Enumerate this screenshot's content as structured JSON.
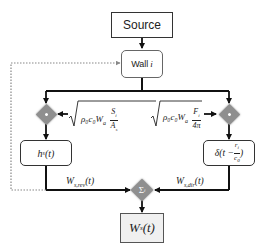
{
  "nodes": {
    "source": "Source",
    "wall": "Wall i",
    "hs": "h_s(t)",
    "delta": "δ(t − r_i / c_0)",
    "sum": "Σ_i",
    "ws": "W_s(t)"
  },
  "gains": {
    "left": {
      "prefix": "ρ₀c₀W",
      "sub": "a",
      "num": "S_i",
      "den": "A_s"
    },
    "right": {
      "prefix": "ρ₀c₀W",
      "sub": "a",
      "num": "F_i",
      "den": "4π"
    }
  },
  "edge_labels": {
    "rev": "W_s,rev(t)",
    "dir": "W_s,dir(t)"
  },
  "display": {
    "source": "Source",
    "wall_prefix": "Wall ",
    "wall_var": "i",
    "hs_main": "h",
    "hs_sub": "s",
    "hs_arg": "(t)",
    "delta_main": "δ(t − ",
    "delta_num": "r",
    "delta_num_sub": "i",
    "delta_den": "c",
    "delta_den_sub": "0",
    "delta_close": ")",
    "sum_main": "Σ",
    "sum_sub": "i",
    "ws_main": "W",
    "ws_sub": "s",
    "ws_arg": "(t)",
    "rev_main": "W",
    "rev_sub": "s,rev",
    "rev_arg": "(t)",
    "dir_main": "W",
    "dir_sub": "s,dir",
    "dir_arg": "(t)",
    "gain_prefix": "ρ₀c₀W",
    "gain_sub": "a",
    "gainL_num": "S",
    "gainL_num_sub": "i",
    "gainL_den": "A",
    "gainL_den_sub": "s",
    "gainR_num": "F",
    "gainR_num_sub": "i",
    "gainR_den": "4π"
  },
  "colors": {
    "line": "#111111",
    "feedback": "#888888",
    "diamond": "#8f8f8f",
    "output_fill": "#f0f0f0"
  }
}
